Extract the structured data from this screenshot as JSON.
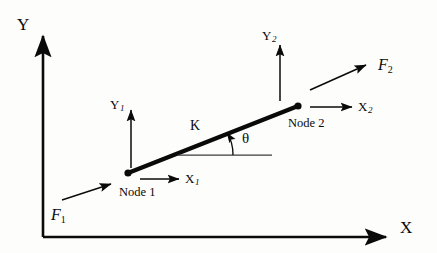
{
  "figure": {
    "type": "engineering-diagram",
    "background_color": "#fdfdfc",
    "ink_color": "#0a0a0a"
  },
  "axes": {
    "y_label": "Y",
    "x_label": "X",
    "origin": {
      "x": 43,
      "y": 237
    },
    "y_tip": {
      "x": 43,
      "y": 31
    },
    "x_tip": {
      "x": 392,
      "y": 237
    }
  },
  "element": {
    "stiffness_label": "K",
    "angle_label": "θ",
    "node1": {
      "name_label": "Node 1",
      "point": {
        "x": 128,
        "y": 173
      },
      "dof_x_label": "X",
      "dof_x_sub": "1",
      "dof_y_label": "Y",
      "dof_y_sub": "1",
      "force_label": "F",
      "force_sub": "1"
    },
    "node2": {
      "name_label": "Node 2",
      "point": {
        "x": 298,
        "y": 106
      },
      "dof_x_label": "X",
      "dof_x_sub": "2",
      "dof_y_label": "Y",
      "dof_y_sub": "2",
      "force_label": "F",
      "force_sub": "2"
    }
  },
  "icons": {
    "arrow_head": "arrowhead-icon",
    "node_marker": "node-dot-icon",
    "angle_arc": "angle-arc-icon"
  }
}
